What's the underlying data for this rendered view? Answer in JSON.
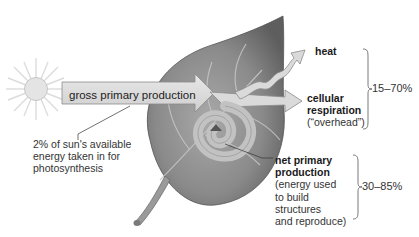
{
  "diagram": {
    "type": "energy-flow",
    "source": {
      "name": "sun",
      "icon": "sun-icon"
    },
    "arrows": {
      "input_label": "gross primary production",
      "input_note": "2% of sun's available energy taken in for photosynthesis"
    },
    "outputs": [
      {
        "id": "heat",
        "title": "heat",
        "subtitle": ""
      },
      {
        "id": "cellular_respiration",
        "title": "cellular respiration",
        "title_line1": "cellular",
        "title_line2": "respiration",
        "subtitle": "(“overhead”)"
      },
      {
        "id": "net_primary_production",
        "title": "net primary production",
        "title_line1": "net primary",
        "title_line2": "production",
        "subtitle_lines": [
          "(energy used",
          "to build",
          "structures",
          "and reproduce)"
        ]
      }
    ],
    "brackets": [
      {
        "groups": [
          "heat",
          "cellular_respiration"
        ],
        "range": "15–70%"
      },
      {
        "groups": [
          "net_primary_production"
        ],
        "range": "30–85%"
      }
    ],
    "colors": {
      "arrow_fill": "#d9d9d9",
      "arrow_stroke": "#8a8a8a",
      "leaf_dark": "#6e6e6e",
      "leaf_light": "#b5b5b5",
      "sun": "#e2e2e2",
      "text": "#1e1e1e"
    }
  }
}
